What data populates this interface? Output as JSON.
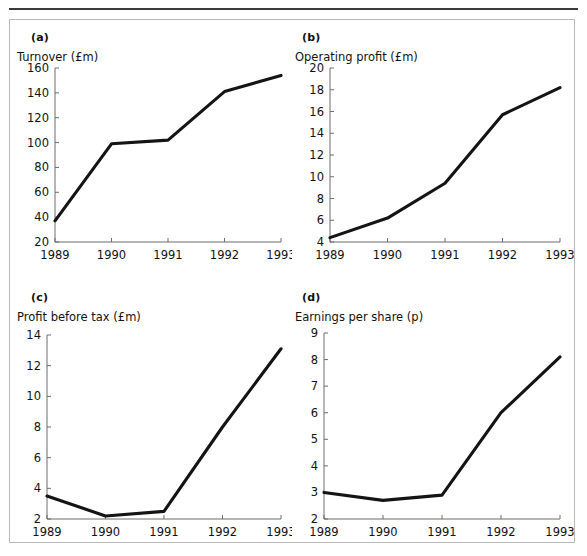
{
  "figure": {
    "background": "#ffffff",
    "frame_color": "#b9b9b9",
    "rule_color": "#3a3a3a",
    "line_color": "#141414",
    "axis_color": "#6d6d6d"
  },
  "panels": [
    {
      "tag": "(a)",
      "axis_label": "Turnover (£m)"
    },
    {
      "tag": "(b)",
      "axis_label": "Operating profit (£m)"
    },
    {
      "tag": "(c)",
      "axis_label": "Profit before tax (£m)"
    },
    {
      "tag": "(d)",
      "axis_label": "Earnings per share (p)"
    }
  ],
  "chart_data": [
    {
      "type": "line",
      "title": "(a)",
      "ylabel": "Turnover (£m)",
      "xlabel": "",
      "categories": [
        "1989",
        "1990",
        "1991",
        "1992",
        "1993"
      ],
      "x": [
        1989,
        1990,
        1991,
        1992,
        1993
      ],
      "values": [
        37,
        99,
        102,
        141,
        154
      ],
      "yticks": [
        20,
        40,
        60,
        80,
        100,
        120,
        140,
        160
      ],
      "ytick_labels": [
        "20",
        "40",
        "60",
        "80",
        "100",
        "120",
        "140",
        "160"
      ],
      "ylim": [
        20,
        160
      ],
      "xlim": [
        1989,
        1993
      ],
      "grid": false,
      "legend": "none"
    },
    {
      "type": "line",
      "title": "(b)",
      "ylabel": "Operating profit (£m)",
      "xlabel": "",
      "categories": [
        "1989",
        "1990",
        "1991",
        "1992",
        "1993"
      ],
      "x": [
        1989,
        1990,
        1991,
        1992,
        1993
      ],
      "values": [
        4.4,
        6.2,
        9.4,
        15.7,
        18.2
      ],
      "yticks": [
        4,
        6,
        8,
        10,
        12,
        14,
        16,
        18,
        20
      ],
      "ytick_labels": [
        "4",
        "6",
        "8",
        "10",
        "12",
        "14",
        "16",
        "18",
        "20"
      ],
      "ylim": [
        4,
        20
      ],
      "xlim": [
        1989,
        1993
      ],
      "grid": false,
      "legend": "none"
    },
    {
      "type": "line",
      "title": "(c)",
      "ylabel": "Profit before tax (£m)",
      "xlabel": "",
      "categories": [
        "1989",
        "1990",
        "1991",
        "1992",
        "1993"
      ],
      "x": [
        1989,
        1990,
        1991,
        1992,
        1993
      ],
      "values": [
        3.5,
        2.2,
        2.5,
        8.0,
        13.1
      ],
      "yticks": [
        2,
        4,
        6,
        8,
        10,
        12,
        14
      ],
      "ytick_labels": [
        "2",
        "4",
        "6",
        "8",
        "10",
        "12",
        "14"
      ],
      "ylim": [
        2,
        14
      ],
      "xlim": [
        1989,
        1993
      ],
      "grid": false,
      "legend": "none"
    },
    {
      "type": "line",
      "title": "(d)",
      "ylabel": "Earnings per share (p)",
      "xlabel": "",
      "categories": [
        "1989",
        "1990",
        "1991",
        "1992",
        "1993"
      ],
      "x": [
        1989,
        1990,
        1991,
        1992,
        1993
      ],
      "values": [
        3.0,
        2.7,
        2.9,
        6.0,
        8.1
      ],
      "yticks": [
        2,
        3,
        4,
        5,
        6,
        7,
        8,
        9
      ],
      "ytick_labels": [
        "2",
        "3",
        "4",
        "5",
        "6",
        "7",
        "8",
        "9"
      ],
      "ylim": [
        2,
        9
      ],
      "xlim": [
        1989,
        1993
      ],
      "grid": false,
      "legend": "none"
    }
  ]
}
